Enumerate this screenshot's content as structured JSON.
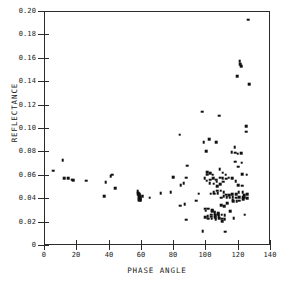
{
  "chart_data": {
    "type": "scatter",
    "title": "",
    "xlabel": "PHASE ANGLE",
    "ylabel": "REFLECTANCE",
    "xlim": [
      0,
      140
    ],
    "ylim": [
      0,
      0.2
    ],
    "xticks": [
      0,
      20,
      40,
      60,
      80,
      100,
      120,
      140
    ],
    "xtick_labels": [
      "0",
      "20",
      "40",
      "60",
      "80",
      "100",
      "120",
      "140"
    ],
    "yticks": [
      0,
      0.02,
      0.04,
      0.06,
      0.08,
      0.1,
      0.12,
      0.14,
      0.16,
      0.18,
      0.2
    ],
    "ytick_labels": [
      "0",
      "0.02",
      "0.04",
      "0.06",
      "0.08",
      "0.10",
      "0.12",
      "0.14",
      "0.16",
      "0.18",
      "0.20"
    ],
    "grid": false,
    "legend": null,
    "marker": "square",
    "marker_color": "#111111",
    "point_count": 150,
    "points": [
      [
        5.2,
        0.0645
      ],
      [
        11.0,
        0.0735
      ],
      [
        12.0,
        0.0578
      ],
      [
        14.2,
        0.0578
      ],
      [
        16.5,
        0.0568
      ],
      [
        17.6,
        0.0562
      ],
      [
        25.6,
        0.0558
      ],
      [
        36.8,
        0.0425
      ],
      [
        37.6,
        0.0545
      ],
      [
        40.8,
        0.0598
      ],
      [
        41.6,
        0.0608
      ],
      [
        43.6,
        0.0492
      ],
      [
        57.4,
        0.0468
      ],
      [
        57.6,
        0.0455
      ],
      [
        57.8,
        0.0442
      ],
      [
        58.0,
        0.0432
      ],
      [
        58.1,
        0.042
      ],
      [
        58.2,
        0.0412
      ],
      [
        58.3,
        0.04
      ],
      [
        58.4,
        0.039
      ],
      [
        58.5,
        0.0448
      ],
      [
        58.6,
        0.0436
      ],
      [
        58.8,
        0.0424
      ],
      [
        59.0,
        0.0412
      ],
      [
        59.2,
        0.0402
      ],
      [
        59.4,
        0.0392
      ],
      [
        60.4,
        0.0428
      ],
      [
        64.8,
        0.0412
      ],
      [
        71.6,
        0.0452
      ],
      [
        77.8,
        0.0462
      ],
      [
        79.4,
        0.0588
      ],
      [
        83.4,
        0.0952
      ],
      [
        83.6,
        0.0345
      ],
      [
        84.0,
        0.0518
      ],
      [
        85.8,
        0.0538
      ],
      [
        86.6,
        0.0355
      ],
      [
        87.4,
        0.0225
      ],
      [
        87.6,
        0.0585
      ],
      [
        88.2,
        0.0688
      ],
      [
        93.8,
        0.0388
      ],
      [
        95.2,
        0.0448
      ],
      [
        97.4,
        0.1148
      ],
      [
        97.6,
        0.0128
      ],
      [
        98.4,
        0.0885
      ],
      [
        99.0,
        0.0578
      ],
      [
        99.2,
        0.0248
      ],
      [
        99.4,
        0.0318
      ],
      [
        99.6,
        0.0302
      ],
      [
        100.0,
        0.0808
      ],
      [
        100.2,
        0.0558
      ],
      [
        100.4,
        0.0632
      ],
      [
        100.6,
        0.0608
      ],
      [
        100.8,
        0.0255
      ],
      [
        101.0,
        0.0235
      ],
      [
        101.2,
        0.0318
      ],
      [
        101.8,
        0.0912
      ],
      [
        102.0,
        0.0538
      ],
      [
        102.2,
        0.0622
      ],
      [
        102.4,
        0.0568
      ],
      [
        102.6,
        0.0448
      ],
      [
        102.8,
        0.0268
      ],
      [
        103.0,
        0.0252
      ],
      [
        103.2,
        0.0232
      ],
      [
        103.4,
        0.0305
      ],
      [
        103.6,
        0.0298
      ],
      [
        104.0,
        0.0608
      ],
      [
        104.2,
        0.0578
      ],
      [
        104.4,
        0.0532
      ],
      [
        104.6,
        0.0462
      ],
      [
        104.8,
        0.0448
      ],
      [
        105.0,
        0.0292
      ],
      [
        105.2,
        0.0278
      ],
      [
        105.4,
        0.0262
      ],
      [
        105.6,
        0.0248
      ],
      [
        105.8,
        0.0228
      ],
      [
        106.0,
        0.0888
      ],
      [
        106.2,
        0.0568
      ],
      [
        106.4,
        0.0548
      ],
      [
        106.6,
        0.0512
      ],
      [
        106.8,
        0.0472
      ],
      [
        107.0,
        0.0452
      ],
      [
        107.2,
        0.0282
      ],
      [
        107.4,
        0.0268
      ],
      [
        107.6,
        0.0255
      ],
      [
        107.8,
        0.0238
      ],
      [
        108.0,
        0.1112
      ],
      [
        108.2,
        0.0658
      ],
      [
        108.4,
        0.0585
      ],
      [
        108.6,
        0.0528
      ],
      [
        108.8,
        0.0472
      ],
      [
        109.0,
        0.0412
      ],
      [
        109.2,
        0.0348
      ],
      [
        109.4,
        0.0268
      ],
      [
        109.6,
        0.0232
      ],
      [
        109.8,
        0.0212
      ],
      [
        110.0,
        0.0628
      ],
      [
        110.2,
        0.0582
      ],
      [
        110.4,
        0.0548
      ],
      [
        110.6,
        0.0462
      ],
      [
        110.8,
        0.0425
      ],
      [
        111.0,
        0.0338
      ],
      [
        111.2,
        0.0262
      ],
      [
        111.4,
        0.0228
      ],
      [
        111.6,
        0.0122
      ],
      [
        112.0,
        0.0608
      ],
      [
        112.2,
        0.0575
      ],
      [
        112.4,
        0.0438
      ],
      [
        112.6,
        0.0415
      ],
      [
        112.8,
        0.0365
      ],
      [
        113.8,
        0.0585
      ],
      [
        114.2,
        0.0432
      ],
      [
        114.4,
        0.0412
      ],
      [
        114.8,
        0.0298
      ],
      [
        115.6,
        0.0802
      ],
      [
        115.8,
        0.0578
      ],
      [
        116.0,
        0.0445
      ],
      [
        116.2,
        0.0418
      ],
      [
        116.4,
        0.0392
      ],
      [
        116.6,
        0.0382
      ],
      [
        116.8,
        0.0238
      ],
      [
        117.6,
        0.0845
      ],
      [
        117.8,
        0.0798
      ],
      [
        118.0,
        0.0722
      ],
      [
        118.2,
        0.0552
      ],
      [
        118.4,
        0.0442
      ],
      [
        118.6,
        0.0412
      ],
      [
        118.8,
        0.0382
      ],
      [
        119.2,
        0.1452
      ],
      [
        119.4,
        0.0788
      ],
      [
        119.6,
        0.0678
      ],
      [
        119.8,
        0.0518
      ],
      [
        120.0,
        0.0462
      ],
      [
        120.2,
        0.0418
      ],
      [
        120.4,
        0.0388
      ],
      [
        120.6,
        0.1582
      ],
      [
        120.8,
        0.1552
      ],
      [
        121.4,
        0.1538
      ],
      [
        121.6,
        0.0792
      ],
      [
        121.8,
        0.0712
      ],
      [
        122.0,
        0.0612
      ],
      [
        122.2,
        0.0515
      ],
      [
        122.4,
        0.0462
      ],
      [
        122.6,
        0.0415
      ],
      [
        122.8,
        0.0398
      ],
      [
        123.4,
        0.0435
      ],
      [
        123.6,
        0.0412
      ],
      [
        123.8,
        0.0268
      ],
      [
        124.6,
        0.1022
      ],
      [
        124.8,
        0.0978
      ],
      [
        125.0,
        0.0608
      ],
      [
        125.2,
        0.0445
      ],
      [
        125.4,
        0.0408
      ],
      [
        125.8,
        0.1935
      ],
      [
        126.4,
        0.1385
      ]
    ]
  }
}
